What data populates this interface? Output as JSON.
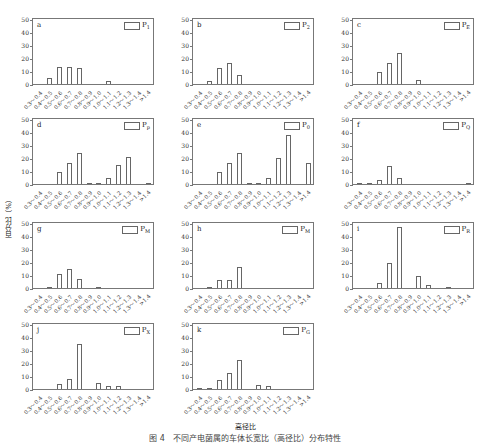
{
  "figure": {
    "ylabel": "百分比（%）",
    "xlabel": "高径比",
    "caption": "图 4　不同产电菌属的车体长宽比（高径比）分布特性"
  },
  "chart_data": [
    {
      "type": "bar",
      "panel": "a",
      "legend": "P",
      "legend_sub": "1",
      "ylim": [
        0,
        50
      ],
      "yticks": [
        0,
        10,
        20,
        30,
        40,
        50
      ],
      "categories": [
        "0.3～0.4",
        "0.4～0.5",
        "0.5～0.6",
        "0.6～0.7",
        "0.7～0.8",
        "0.8～0.9",
        "0.9～1.0",
        "1.0～1.1",
        "1.1～1.2",
        "1.2～1.3",
        "1.3～1.4",
        ">1.4"
      ],
      "values": [
        0,
        5,
        13,
        13,
        12,
        0,
        0,
        2,
        0,
        0,
        0,
        0
      ]
    },
    {
      "type": "bar",
      "panel": "b",
      "legend": "P",
      "legend_sub": "2",
      "ylim": [
        0,
        50
      ],
      "yticks": [
        0,
        10,
        20,
        30,
        40,
        50
      ],
      "categories": [
        "0.3～0.4",
        "0.4～0.5",
        "0.5～0.6",
        "0.6～0.7",
        "0.7～0.8",
        "0.8～0.9",
        "0.9～1.0",
        "1.0～1.1",
        "1.1～1.2",
        "1.2～1.3",
        "1.3～1.4",
        ">1.4"
      ],
      "values": [
        0,
        2,
        12,
        16,
        7,
        0,
        0,
        0,
        0,
        0,
        0,
        0
      ]
    },
    {
      "type": "bar",
      "panel": "c",
      "legend": "P",
      "legend_sub": "E",
      "ylim": [
        0,
        50
      ],
      "yticks": [
        0,
        10,
        20,
        30,
        40,
        50
      ],
      "categories": [
        "0.3～0.4",
        "0.4～0.5",
        "0.5～0.6",
        "0.6～0.7",
        "0.7～0.8",
        "0.8～0.9",
        "0.9～1.0",
        "1.0～1.1",
        "1.1～1.2",
        "1.2～1.3",
        "1.3～1.4",
        ">1.4"
      ],
      "values": [
        0,
        0,
        9,
        16,
        24,
        0,
        3,
        0,
        0,
        0,
        0,
        0
      ]
    },
    {
      "type": "bar",
      "panel": "d",
      "legend": "P",
      "legend_sub": "p",
      "ylim": [
        0,
        50
      ],
      "yticks": [
        0,
        10,
        20,
        30,
        40,
        50
      ],
      "categories": [
        "0.3～0.4",
        "0.4～0.5",
        "0.5～0.6",
        "0.6～0.7",
        "0.7～0.8",
        "0.8～0.9",
        "0.9～1.0",
        "1.0～1.1",
        "1.1～1.2",
        "1.2～1.3",
        "1.3～1.4",
        ">1.4"
      ],
      "values": [
        0,
        0,
        9,
        16,
        24,
        1,
        1,
        5,
        15,
        21,
        0,
        1
      ]
    },
    {
      "type": "bar",
      "panel": "e",
      "legend": "P",
      "legend_sub": "0",
      "ylim": [
        0,
        50
      ],
      "yticks": [
        0,
        10,
        20,
        30,
        40,
        50
      ],
      "categories": [
        "0.3～0.4",
        "0.4～0.5",
        "0.5～0.6",
        "0.6～0.7",
        "0.7～0.8",
        "0.8～0.9",
        "0.9～1.0",
        "1.0～1.1",
        "1.1～1.2",
        "1.2～1.3",
        "1.3～1.4",
        ">1.4"
      ],
      "values": [
        0,
        0,
        9,
        16,
        24,
        1,
        1,
        5,
        20,
        38,
        0,
        16
      ]
    },
    {
      "type": "bar",
      "panel": "f",
      "legend": "P",
      "legend_sub": "Q",
      "ylim": [
        0,
        50
      ],
      "yticks": [
        0,
        10,
        20,
        30,
        40,
        50
      ],
      "categories": [
        "0.3～0.4",
        "0.4～0.5",
        "0.5～0.6",
        "0.6～0.7",
        "0.7～0.8",
        "0.8～0.9",
        "0.9～1.0",
        "1.0～1.1",
        "1.1～1.2",
        "1.2～1.3",
        "1.3～1.4",
        ">1.4"
      ],
      "values": [
        1,
        1,
        3,
        14,
        5,
        0,
        0,
        0,
        0,
        0,
        0,
        1
      ]
    },
    {
      "type": "bar",
      "panel": "g",
      "legend": "P",
      "legend_sub": "M",
      "ylim": [
        0,
        50
      ],
      "yticks": [
        0,
        10,
        20,
        30,
        40,
        50
      ],
      "categories": [
        "0.3～0.4",
        "0.4～0.5",
        "0.5～0.6",
        "0.6～0.7",
        "0.7～0.8",
        "0.8～0.9",
        "0.9～1.0",
        "1.0～1.1",
        "1.1～1.2",
        "1.2～1.3",
        "1.3～1.4",
        ">1.4"
      ],
      "values": [
        0,
        1,
        11,
        15,
        7,
        0,
        1,
        0,
        0,
        0,
        0,
        0
      ]
    },
    {
      "type": "bar",
      "panel": "h",
      "legend": "P",
      "legend_sub": "M",
      "ylim": [
        0,
        50
      ],
      "yticks": [
        0,
        10,
        20,
        30,
        40,
        50
      ],
      "categories": [
        "0.3～0.4",
        "0.4～0.5",
        "0.5～0.6",
        "0.6～0.7",
        "0.7～0.8",
        "0.8～0.9",
        "0.9～1.0",
        "1.0～1.1",
        "1.1～1.2",
        "1.2～1.3",
        "1.3～1.4",
        ">1.4"
      ],
      "values": [
        0,
        1,
        6,
        6,
        16,
        0,
        0,
        0,
        0,
        0,
        0,
        0
      ]
    },
    {
      "type": "bar",
      "panel": "i",
      "legend": "P",
      "legend_sub": "R",
      "ylim": [
        0,
        50
      ],
      "yticks": [
        0,
        10,
        20,
        30,
        40,
        50
      ],
      "categories": [
        "0.3～0.4",
        "0.4～0.5",
        "0.5～0.6",
        "0.6～0.7",
        "0.7～0.8",
        "0.8～0.9",
        "0.9～1.0",
        "1.0～1.1",
        "1.1～1.2",
        "1.2～1.3",
        "1.3～1.4",
        ">1.4"
      ],
      "values": [
        0,
        0,
        4,
        19,
        47,
        0,
        9,
        2,
        0,
        1,
        0,
        0
      ]
    },
    {
      "type": "bar",
      "panel": "j",
      "legend": "P",
      "legend_sub": "X",
      "ylim": [
        0,
        50
      ],
      "yticks": [
        0,
        10,
        20,
        30,
        40,
        50
      ],
      "categories": [
        "0.3～0.4",
        "0.4～0.5",
        "0.5～0.6",
        "0.6～0.7",
        "0.7～0.8",
        "0.8～0.9",
        "0.9～1.0",
        "1.0～1.1",
        "1.1～1.2",
        "1.2～1.3",
        "1.3～1.4",
        ">1.4"
      ],
      "values": [
        0,
        0,
        4,
        8,
        35,
        0,
        5,
        2,
        2,
        0,
        0,
        0
      ]
    },
    {
      "type": "bar",
      "panel": "k",
      "legend": "P",
      "legend_sub": "G",
      "ylim": [
        0,
        50
      ],
      "yticks": [
        0,
        10,
        20,
        30,
        40,
        50
      ],
      "categories": [
        "0.3～0.4",
        "0.4～0.5",
        "0.5～0.6",
        "0.6～0.7",
        "0.7～0.8",
        "0.8～0.9",
        "0.9～1.0",
        "1.0～1.1",
        "1.1～1.2",
        "1.2～1.3",
        "1.3～1.4",
        ">1.4"
      ],
      "values": [
        1,
        1,
        7,
        12,
        22,
        0,
        3,
        2,
        0,
        0,
        0,
        0
      ]
    }
  ],
  "layout": {
    "positions": [
      [
        2,
        18
      ],
      [
        162,
        18
      ],
      [
        322,
        18
      ],
      [
        2,
        118
      ],
      [
        162,
        118
      ],
      [
        322,
        118
      ],
      [
        2,
        222
      ],
      [
        162,
        222
      ],
      [
        322,
        222
      ],
      [
        2,
        323
      ],
      [
        162,
        323
      ]
    ]
  }
}
